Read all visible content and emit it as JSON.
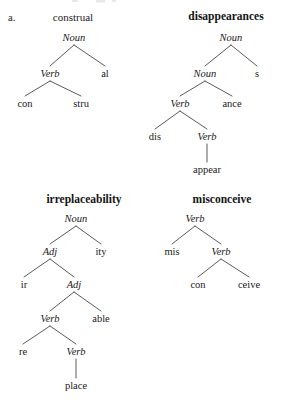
{
  "figure": {
    "item_label": "a.",
    "background_color": "#ffffff",
    "ink_color": "#1a1a1a",
    "branch_color": "#30302e"
  },
  "trees": [
    {
      "id": "construal",
      "headword": "construal",
      "headword_weight": "regular",
      "nodes": [
        {
          "id": "c-root",
          "text": "Noun",
          "style": "category",
          "x": 74,
          "y": 41
        },
        {
          "id": "c-verb",
          "text": "Verb",
          "style": "category",
          "x": 50,
          "y": 77
        },
        {
          "id": "c-al",
          "text": "al",
          "style": "morph",
          "x": 105,
          "y": 77
        },
        {
          "id": "c-con",
          "text": "con",
          "style": "morph",
          "x": 25,
          "y": 107
        },
        {
          "id": "c-stru",
          "text": "stru",
          "style": "morph",
          "x": 81,
          "y": 107
        }
      ],
      "edges": [
        {
          "from": "c-root",
          "to": "c-verb"
        },
        {
          "from": "c-root",
          "to": "c-al"
        },
        {
          "from": "c-verb",
          "to": "c-con"
        },
        {
          "from": "c-verb",
          "to": "c-stru"
        }
      ]
    },
    {
      "id": "disappearances",
      "headword": "disappearances",
      "headword_weight": "bold",
      "nodes": [
        {
          "id": "d-root",
          "text": "Noun",
          "style": "category",
          "x": 231,
          "y": 41
        },
        {
          "id": "d-noun2",
          "text": "Noun",
          "style": "category",
          "x": 205,
          "y": 77
        },
        {
          "id": "d-s",
          "text": "s",
          "style": "morph",
          "x": 257,
          "y": 77
        },
        {
          "id": "d-verb",
          "text": "Verb",
          "style": "category",
          "x": 180,
          "y": 107
        },
        {
          "id": "d-ance",
          "text": "ance",
          "style": "morph",
          "x": 232,
          "y": 107
        },
        {
          "id": "d-dis",
          "text": "dis",
          "style": "morph",
          "x": 155,
          "y": 140
        },
        {
          "id": "d-verb2",
          "text": "Verb",
          "style": "category",
          "x": 207,
          "y": 140
        },
        {
          "id": "d-appear",
          "text": "appear",
          "style": "morph",
          "x": 207,
          "y": 173
        }
      ],
      "edges": [
        {
          "from": "d-root",
          "to": "d-noun2"
        },
        {
          "from": "d-root",
          "to": "d-s"
        },
        {
          "from": "d-noun2",
          "to": "d-verb"
        },
        {
          "from": "d-noun2",
          "to": "d-ance"
        },
        {
          "from": "d-verb",
          "to": "d-dis"
        },
        {
          "from": "d-verb",
          "to": "d-verb2"
        },
        {
          "from": "d-verb2",
          "to": "d-appear"
        }
      ]
    },
    {
      "id": "irreplaceability",
      "headword": "irreplaceability",
      "headword_weight": "bold",
      "nodes": [
        {
          "id": "i-root",
          "text": "Noun",
          "style": "category",
          "x": 76,
          "y": 222
        },
        {
          "id": "i-adj1",
          "text": "Adj",
          "style": "category",
          "x": 50,
          "y": 255
        },
        {
          "id": "i-ity",
          "text": "ity",
          "style": "morph",
          "x": 101,
          "y": 255
        },
        {
          "id": "i-ir",
          "text": "ir",
          "style": "morph",
          "x": 24,
          "y": 288
        },
        {
          "id": "i-adj2",
          "text": "Adj",
          "style": "category",
          "x": 74,
          "y": 288
        },
        {
          "id": "i-verb1",
          "text": "Verb",
          "style": "category",
          "x": 50,
          "y": 322
        },
        {
          "id": "i-able",
          "text": "able",
          "style": "morph",
          "x": 101,
          "y": 322
        },
        {
          "id": "i-re",
          "text": "re",
          "style": "morph",
          "x": 23,
          "y": 355
        },
        {
          "id": "i-verb2",
          "text": "Verb",
          "style": "category",
          "x": 76,
          "y": 355
        },
        {
          "id": "i-place",
          "text": "place",
          "style": "morph",
          "x": 76,
          "y": 389
        }
      ],
      "edges": [
        {
          "from": "i-root",
          "to": "i-adj1"
        },
        {
          "from": "i-root",
          "to": "i-ity"
        },
        {
          "from": "i-adj1",
          "to": "i-ir"
        },
        {
          "from": "i-adj1",
          "to": "i-adj2"
        },
        {
          "from": "i-adj2",
          "to": "i-verb1"
        },
        {
          "from": "i-adj2",
          "to": "i-able"
        },
        {
          "from": "i-verb1",
          "to": "i-re"
        },
        {
          "from": "i-verb1",
          "to": "i-verb2"
        },
        {
          "from": "i-verb2",
          "to": "i-place"
        }
      ]
    },
    {
      "id": "misconceive",
      "headword": "misconceive",
      "headword_weight": "bold",
      "nodes": [
        {
          "id": "m-root",
          "text": "Verb",
          "style": "category",
          "x": 195,
          "y": 222
        },
        {
          "id": "m-mis",
          "text": "mis",
          "style": "morph",
          "x": 172,
          "y": 255
        },
        {
          "id": "m-verb2",
          "text": "Verb",
          "style": "category",
          "x": 221,
          "y": 255
        },
        {
          "id": "m-con",
          "text": "con",
          "style": "morph",
          "x": 198,
          "y": 288
        },
        {
          "id": "m-ceive",
          "text": "ceive",
          "style": "morph",
          "x": 249,
          "y": 288
        }
      ],
      "edges": [
        {
          "from": "m-root",
          "to": "m-mis"
        },
        {
          "from": "m-root",
          "to": "m-verb2"
        },
        {
          "from": "m-verb2",
          "to": "m-con"
        },
        {
          "from": "m-verb2",
          "to": "m-ceive"
        }
      ]
    }
  ],
  "headword_positions": {
    "construal": {
      "x": 73,
      "y": 21
    },
    "disappearances": {
      "x": 226,
      "y": 20
    },
    "irreplaceability": {
      "x": 84,
      "y": 203
    },
    "misconceive": {
      "x": 222,
      "y": 203
    }
  },
  "item_label_position": {
    "x": 8,
    "y": 21
  }
}
